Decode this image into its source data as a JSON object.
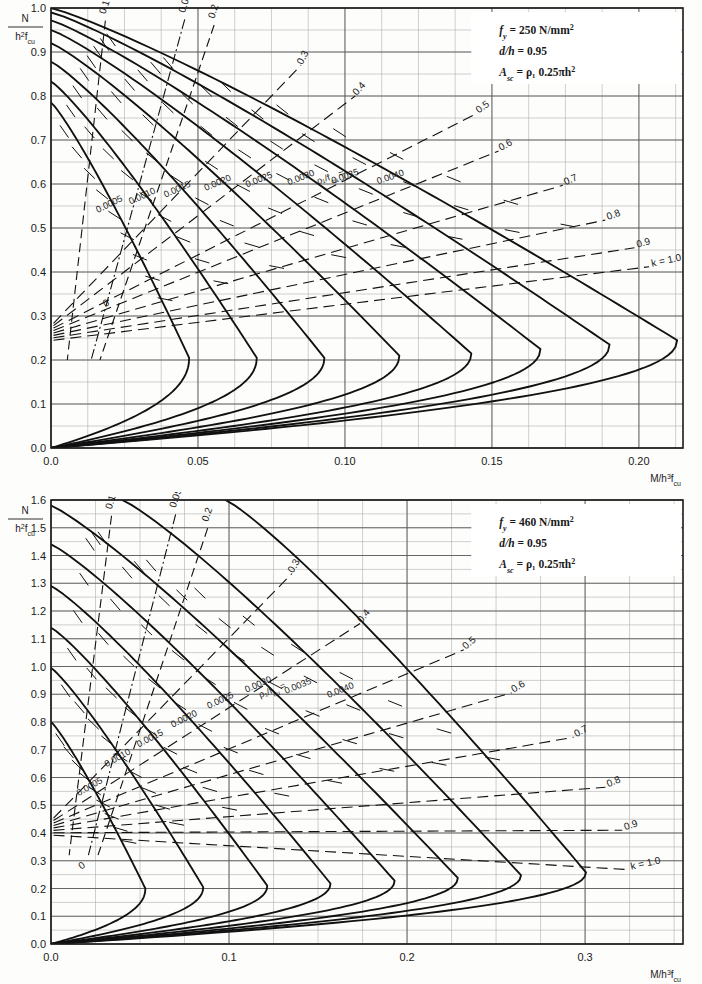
{
  "page": {
    "background": "#fdfdfb"
  },
  "colors": {
    "major_grid": "#5a5a5a",
    "minor_grid": "#a8a8a8",
    "curve": "#111111",
    "dashed": "#111111",
    "frame": "#1a1a1a",
    "text": "#1a1a1a"
  },
  "charts": [
    {
      "id": "chart-top",
      "type": "line",
      "title": "",
      "xlabel": "M/h³f_cu",
      "ylabel": "N / h²f_cu",
      "ylabel_num": "N",
      "ylabel_den": "h²f_cu",
      "xlabel_main": "M/h",
      "xlabel_sup": "3",
      "xlabel_f": "f",
      "xlabel_sub": "cu",
      "xlim": [
        0.0,
        0.215
      ],
      "ylim": [
        0.0,
        1.0
      ],
      "xticks": [
        0.0,
        0.05,
        0.1,
        0.15,
        0.2
      ],
      "xtick_labels": [
        "0.0",
        "0.05",
        "0.10",
        "0.15",
        "0.20"
      ],
      "xminor_step": 0.0125,
      "yticks": [
        0.0,
        0.1,
        0.2,
        0.3,
        0.4,
        0.5,
        0.6,
        0.7,
        0.8,
        0.9,
        1.0
      ],
      "ytick_labels": [
        "0.0",
        "0.1",
        "0.2",
        "0.3",
        "0.4",
        "0.5",
        "0.6",
        "0.7",
        "0.8",
        "0.9",
        "1.0"
      ],
      "yminor_step": 0.05,
      "grid": true,
      "legend_position": "top-right",
      "info_box": {
        "fy_label": "f",
        "fy_sub": "y",
        "fy_eq": "=",
        "fy_value": "250 N/mm",
        "fy_sup": "2",
        "dh_label": "d/h",
        "dh_eq": "=",
        "dh_value": "0.95",
        "asc_label": "A",
        "asc_sub": "sc",
        "asc_eq": "=",
        "asc_value": "ρ₁ 0.25πh",
        "asc_sup": "2"
      },
      "rho_series_label": "ρ₁/f",
      "rho_series_label_sub": "cu",
      "rho_series_label_eq": "=",
      "rho_series": [
        {
          "name": "0.0005",
          "label": "0.0005",
          "N0": 0.268,
          "Mmax": 0.047,
          "Ntop": 0.785,
          "Mtop": 0.0,
          "Nbend": 0.3,
          "knee_y": 0.205,
          "knee_x": 0.0455
        },
        {
          "name": "0.0010",
          "label": "0.0010",
          "N0": 0.305,
          "Mmax": 0.07,
          "Ntop": 0.833,
          "Mtop": 0.0,
          "Nbend": 0.32,
          "knee_y": 0.205,
          "knee_x": 0.068
        },
        {
          "name": "0.0015",
          "label": "0.0015",
          "N0": 0.338,
          "Mmax": 0.093,
          "Ntop": 0.878,
          "Mtop": 0.0,
          "Nbend": 0.34,
          "knee_y": 0.205,
          "knee_x": 0.0905
        },
        {
          "name": "0.0020",
          "label": "0.0020",
          "N0": 0.36,
          "Mmax": 0.1185,
          "Ntop": 0.92,
          "Mtop": 0.0,
          "Nbend": 0.36,
          "knee_y": 0.21,
          "knee_x": 0.118
        },
        {
          "name": "0.0025",
          "label": "0.0025",
          "N0": 0.382,
          "Mmax": 0.143,
          "Ntop": 0.95,
          "Mtop": 0.0,
          "Nbend": 0.38,
          "knee_y": 0.215,
          "knee_x": 0.1425
        },
        {
          "name": "0.0030",
          "label": "0.0030",
          "N0": 0.4,
          "Mmax": 0.1665,
          "Ntop": 0.972,
          "Mtop": 0.0,
          "Nbend": 0.4,
          "knee_y": 0.225,
          "knee_x": 0.166
        },
        {
          "name": "0.0035",
          "label": "0.0035",
          "N0": 0.415,
          "Mmax": 0.19,
          "Ntop": 0.99,
          "Mtop": 0.0,
          "Nbend": 0.41,
          "knee_y": 0.235,
          "knee_x": 0.1895
        },
        {
          "name": "0.0040",
          "label": "0.0040",
          "N0": 0.428,
          "Mmax": 0.213,
          "Ntop": 1.0,
          "Mtop": 0.0,
          "Nbend": 0.43,
          "knee_y": 0.245,
          "knee_x": 0.2125
        }
      ],
      "k_labels_top": [
        {
          "label": "0.1",
          "x": 0.0185,
          "y": 0.985,
          "rot": -72
        },
        {
          "label": "0.05h",
          "x": 0.0455,
          "y": 0.988,
          "rot": -72,
          "dashdot": true
        },
        {
          "label": "0.2",
          "x": 0.0555,
          "y": 0.975,
          "rot": -72
        },
        {
          "label": "0.3",
          "x": 0.0855,
          "y": 0.87,
          "rot": -62
        },
        {
          "label": "0.4",
          "x": 0.104,
          "y": 0.8,
          "rot": -48
        },
        {
          "label": "0.5",
          "x": 0.1455,
          "y": 0.76,
          "rot": -36
        },
        {
          "label": "0.6",
          "x": 0.153,
          "y": 0.675,
          "rot": -28
        },
        {
          "label": "0.7",
          "x": 0.175,
          "y": 0.597,
          "rot": -24
        },
        {
          "label": "0.8",
          "x": 0.1895,
          "y": 0.518,
          "rot": -20
        },
        {
          "label": "0.9",
          "x": 0.1995,
          "y": 0.455,
          "rot": -16
        },
        {
          "label": "k = 1.0",
          "x": 0.2045,
          "y": 0.412,
          "rot": -12
        }
      ],
      "k_lower_labels": [
        {
          "label": "0",
          "x": 0.0185,
          "y": 0.32,
          "rot": -30
        }
      ]
    },
    {
      "id": "chart-bottom",
      "type": "line",
      "title": "",
      "xlabel": "M/h³f_cu",
      "ylabel": "N / h²f_cu",
      "ylabel_num": "N",
      "ylabel_den": "h²f_cu",
      "xlabel_main": "M/h",
      "xlabel_sup": "3",
      "xlabel_f": "f",
      "xlabel_sub": "cu",
      "xlim": [
        0.0,
        0.355
      ],
      "ylim": [
        0.0,
        1.6
      ],
      "xticks": [
        0.0,
        0.1,
        0.2,
        0.3
      ],
      "xtick_labels": [
        "0.0",
        "0.1",
        "0.2",
        "0.3"
      ],
      "xminor_step": 0.025,
      "yticks": [
        0.0,
        0.1,
        0.2,
        0.3,
        0.4,
        0.5,
        0.6,
        0.7,
        0.8,
        0.9,
        1.0,
        1.1,
        1.2,
        1.3,
        1.4,
        1.5,
        1.6
      ],
      "ytick_labels": [
        "0.0",
        "0.1",
        "0.2",
        "0.3",
        "0.4",
        "0.5",
        "0.6",
        "0.7",
        "0.8",
        "0.9",
        "1.0",
        "1.1",
        "1.2",
        "1.3",
        "1.4",
        "1.5",
        "1.6"
      ],
      "yminor_step": 0.05,
      "grid": true,
      "legend_position": "top-right",
      "info_box": {
        "fy_label": "f",
        "fy_sub": "y",
        "fy_eq": "=",
        "fy_value": "460 N/mm",
        "fy_sup": "2",
        "dh_label": "d/h",
        "dh_eq": "=",
        "dh_value": "0.95",
        "asc_label": "A",
        "asc_sub": "sc",
        "asc_eq": "=",
        "asc_value": "ρ₁ 0.25πh",
        "asc_sup": "2"
      },
      "rho_series_label": "ρ₁/f",
      "rho_series_label_sub": "cu",
      "rho_series_label_eq": "=",
      "rho_series": [
        {
          "name": "0.0005",
          "label": "0.0005",
          "N0": 0.3,
          "Mmax": 0.053,
          "Ntop": 0.8,
          "Mtop": 0.0,
          "knee_y": 0.2,
          "knee_x": 0.052
        },
        {
          "name": "0.0010",
          "label": "0.0010",
          "N0": 0.345,
          "Mmax": 0.0855,
          "Ntop": 0.995,
          "Mtop": 0.0,
          "knee_y": 0.205,
          "knee_x": 0.0845
        },
        {
          "name": "0.0015",
          "label": "0.0015",
          "N0": 0.385,
          "Mmax": 0.1215,
          "Ntop": 1.14,
          "Mtop": 0.0,
          "knee_y": 0.21,
          "knee_x": 0.1205
        },
        {
          "name": "0.0020",
          "label": "0.0020",
          "N0": 0.42,
          "Mmax": 0.157,
          "Ntop": 1.29,
          "Mtop": 0.0,
          "knee_y": 0.218,
          "knee_x": 0.156
        },
        {
          "name": "0.0025",
          "label": "0.0025",
          "N0": 0.45,
          "Mmax": 0.193,
          "Ntop": 1.44,
          "Mtop": 0.0,
          "knee_y": 0.228,
          "knee_x": 0.192
        },
        {
          "name": "0.0030",
          "label": "0.0030",
          "N0": 0.478,
          "Mmax": 0.2285,
          "Ntop": 1.58,
          "Mtop": 0.0,
          "knee_y": 0.238,
          "knee_x": 0.2275
        },
        {
          "name": "0.0035",
          "label": "0.0035",
          "N0": 0.5,
          "Mmax": 0.264,
          "Ntop": 1.6,
          "Mtop": 0.04,
          "knee_y": 0.248,
          "knee_x": 0.263
        },
        {
          "name": "0.0040",
          "label": "0.0040",
          "N0": 0.522,
          "Mmax": 0.3005,
          "Ntop": 1.6,
          "Mtop": 0.098,
          "knee_y": 0.258,
          "knee_x": 0.2995
        }
      ],
      "k_labels_top": [
        {
          "label": "0.1",
          "x": 0.034,
          "y": 1.565,
          "rot": -72
        },
        {
          "label": "0.05h",
          "x": 0.07,
          "y": 1.57,
          "rot": -72,
          "dashdot": true
        },
        {
          "label": "0.2",
          "x": 0.088,
          "y": 1.52,
          "rot": -70
        },
        {
          "label": "0.3",
          "x": 0.136,
          "y": 1.335,
          "rot": -60
        },
        {
          "label": "0.4",
          "x": 0.1745,
          "y": 1.155,
          "rot": -50
        },
        {
          "label": "0.5",
          "x": 0.233,
          "y": 1.06,
          "rot": -40
        },
        {
          "label": "0.6",
          "x": 0.26,
          "y": 0.905,
          "rot": -32
        },
        {
          "label": "0.7",
          "x": 0.295,
          "y": 0.745,
          "rot": -28
        },
        {
          "label": "0.8",
          "x": 0.313,
          "y": 0.565,
          "rot": -22
        },
        {
          "label": "0.9",
          "x": 0.3225,
          "y": 0.41,
          "rot": -18
        },
        {
          "label": "k = 1.0",
          "x": 0.326,
          "y": 0.268,
          "rot": -12
        }
      ],
      "k_lower_labels": [
        {
          "label": "0",
          "x": 0.017,
          "y": 0.268,
          "rot": -34
        }
      ]
    }
  ]
}
